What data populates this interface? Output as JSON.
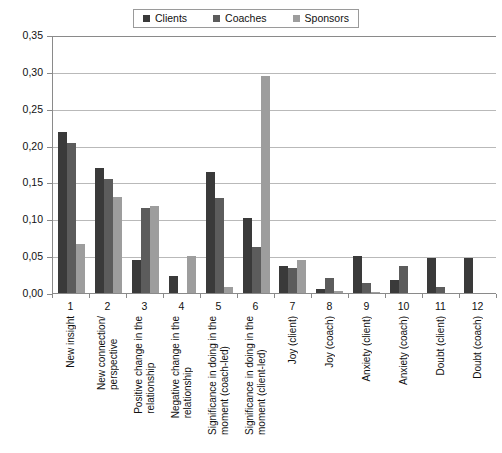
{
  "legend": {
    "position": "top-center",
    "entries": [
      {
        "label": "Clients",
        "color": "#3a3a3a",
        "icon": "legend-square-icon"
      },
      {
        "label": "Coaches",
        "color": "#5c5c5c",
        "icon": "legend-square-icon"
      },
      {
        "label": "Sponsors",
        "color": "#9d9d9d",
        "icon": "legend-square-icon"
      }
    ]
  },
  "axis": {
    "y_ticks": [
      "0,35",
      "0,30",
      "0,25",
      "0,20",
      "0,15",
      "0,10",
      "0,05",
      "0,00"
    ],
    "x_numbers": [
      "1",
      "2",
      "3",
      "4",
      "5",
      "6",
      "7",
      "8",
      "9",
      "10",
      "11",
      "12"
    ]
  },
  "chart_data": {
    "type": "bar",
    "title": "",
    "subtitle": "",
    "xlabel": "",
    "ylabel": "",
    "ylim": [
      0,
      0.35
    ],
    "ytick_step": 0.05,
    "grid": true,
    "legend_position": "top-center",
    "decimal_separator": ",",
    "categories": [
      "New insight",
      "New connection/ perspective",
      "Positive change in the relationship",
      "Negative change in the relationship",
      "Significance in doing in the moment (coach-led)",
      "Significance in doing in the moment (client-led)",
      "Joy (client)",
      "Joy (coach)",
      "Anxiety (client)",
      "Anxiety (coach)",
      "Doubt (client)",
      "Doubt (coach)"
    ],
    "category_labels_multiline": [
      "New insight",
      "New connection/\nperspective",
      "Positive change in the\nrelationship",
      "Negative change in the\nrelationship",
      "Significance in doing in the\nmoment (coach-led)",
      "Significance in doing in the\nmoment (client-led)",
      "Joy (client)",
      "Joy (coach)",
      "Anxiety (client)",
      "Anxiety (coach)",
      "Doubt (client)",
      "Doubt (coach)"
    ],
    "series": [
      {
        "name": "Clients",
        "color": "#3a3a3a",
        "values": [
          0.218,
          0.17,
          0.045,
          0.023,
          0.164,
          0.102,
          0.037,
          0.005,
          0.05,
          0.017,
          0.048,
          0.048
        ]
      },
      {
        "name": "Coaches",
        "color": "#5c5c5c",
        "values": [
          0.203,
          0.155,
          0.115,
          0.0,
          0.129,
          0.063,
          0.034,
          0.02,
          0.013,
          0.036,
          0.008,
          0.0
        ]
      },
      {
        "name": "Sponsors",
        "color": "#9d9d9d",
        "values": [
          0.066,
          0.13,
          0.118,
          0.05,
          0.008,
          0.294,
          0.045,
          0.003,
          0.002,
          0.0,
          0.0,
          0.0
        ]
      }
    ]
  }
}
